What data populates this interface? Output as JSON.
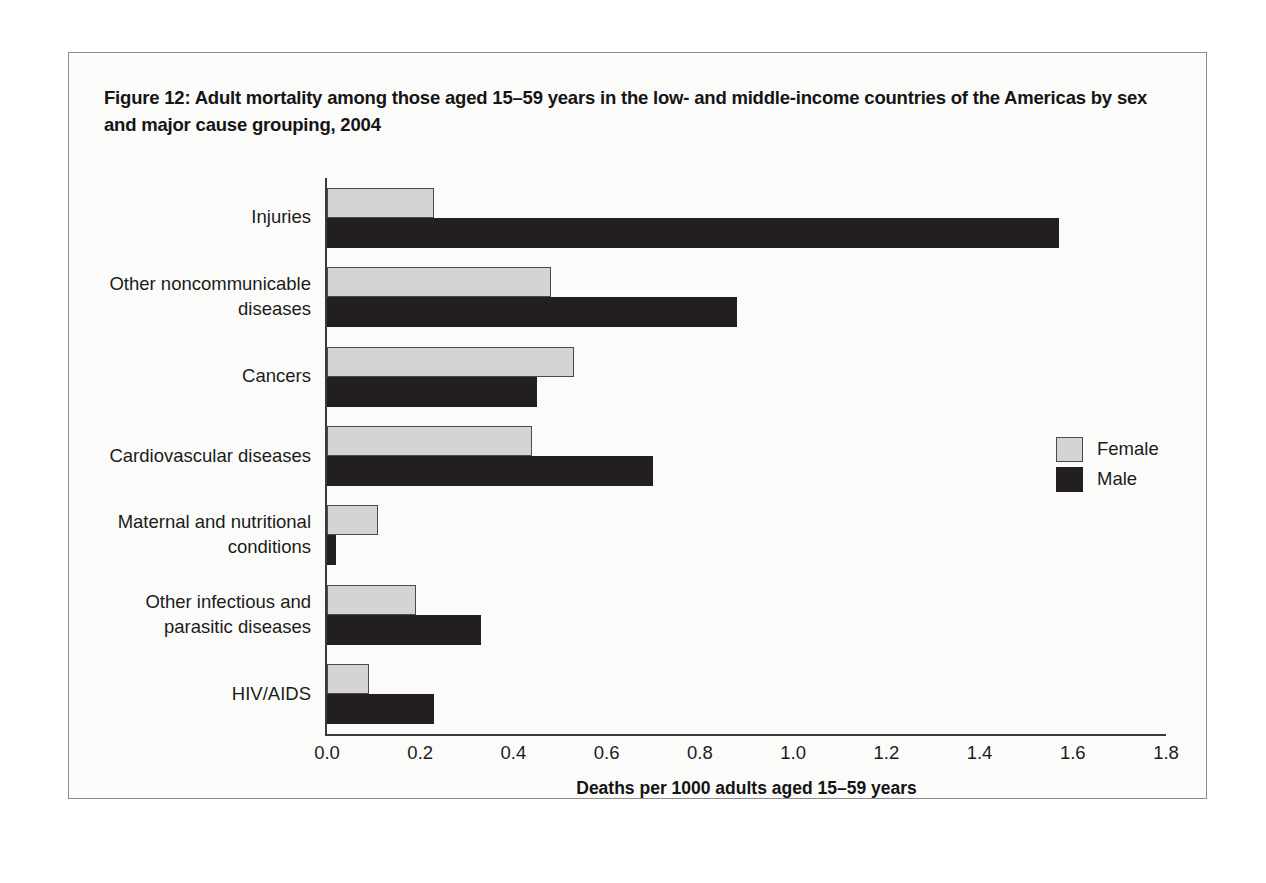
{
  "figure": {
    "title": "Figure 12: Adult mortality among those aged 15–59 years in the low- and middle-income countries of the Americas by sex and major cause grouping, 2004"
  },
  "legend": {
    "position": "right",
    "entries": [
      {
        "label": "Female",
        "color": "#d4d4d4"
      },
      {
        "label": "Male",
        "color": "#231f20"
      }
    ]
  },
  "axis": {
    "x_title": "Deaths per 1000 adults aged 15–59 years",
    "x_ticks": [
      "0.0",
      "0.2",
      "0.4",
      "0.6",
      "0.8",
      "1.0",
      "1.2",
      "1.4",
      "1.6",
      "1.8"
    ]
  },
  "chart_data": {
    "type": "bar",
    "orientation": "horizontal",
    "title": "Figure 12: Adult mortality among those aged 15–59 years in the low- and middle-income countries of the Americas by sex and major cause grouping, 2004",
    "xlabel": "Deaths per 1000 adults aged 15–59 years",
    "ylabel": "",
    "xlim": [
      0.0,
      1.8
    ],
    "xticks": [
      0.0,
      0.2,
      0.4,
      0.6,
      0.8,
      1.0,
      1.2,
      1.4,
      1.6,
      1.8
    ],
    "grid": false,
    "legend_position": "right",
    "categories": [
      "Injuries",
      "Other noncommunicable diseases",
      "Cancers",
      "Cardiovascular diseases",
      "Maternal and nutritional conditions",
      "Other infectious and parasitic diseases",
      "HIV/AIDS"
    ],
    "category_lines": [
      [
        "Injuries"
      ],
      [
        "Other noncommunicable",
        "diseases"
      ],
      [
        "Cancers"
      ],
      [
        "Cardiovascular diseases"
      ],
      [
        "Maternal and nutritional",
        "conditions"
      ],
      [
        "Other infectious and",
        "parasitic diseases"
      ],
      [
        "HIV/AIDS"
      ]
    ],
    "series": [
      {
        "name": "Female",
        "color": "#d4d4d4",
        "values": [
          0.23,
          0.48,
          0.53,
          0.44,
          0.11,
          0.19,
          0.09
        ]
      },
      {
        "name": "Male",
        "color": "#231f20",
        "values": [
          1.57,
          0.88,
          0.45,
          0.7,
          0.02,
          0.33,
          0.23
        ]
      }
    ]
  }
}
